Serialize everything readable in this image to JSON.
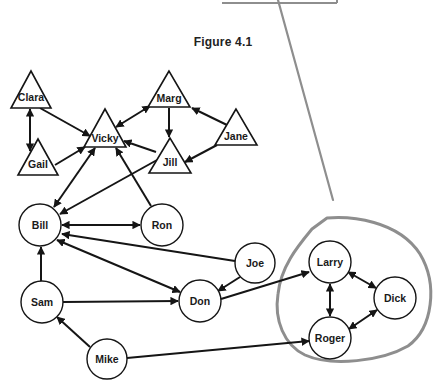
{
  "figure": {
    "title": "Figure 4.1"
  },
  "colors": {
    "ink": "#151515",
    "annotation": "#8e8e8e",
    "node_fill": "#ffffff"
  },
  "nodes": [
    {
      "id": "clara",
      "label": "Clara",
      "shape": "triangle",
      "apex": [
        31,
        71
      ],
      "base_y": 108,
      "half_w": 20,
      "label_y": 101
    },
    {
      "id": "gail",
      "label": "Gail",
      "shape": "triangle",
      "apex": [
        38,
        139
      ],
      "base_y": 175,
      "half_w": 20,
      "label_y": 168
    },
    {
      "id": "vicky",
      "label": "Vicky",
      "shape": "triangle",
      "apex": [
        105,
        109
      ],
      "base_y": 147,
      "half_w": 21,
      "label_y": 142
    },
    {
      "id": "marg",
      "label": "Marg",
      "shape": "triangle",
      "apex": [
        169,
        71
      ],
      "base_y": 107,
      "half_w": 21,
      "label_y": 102
    },
    {
      "id": "jane",
      "label": "Jane",
      "shape": "triangle",
      "apex": [
        236,
        109
      ],
      "base_y": 145,
      "half_w": 21,
      "label_y": 140
    },
    {
      "id": "jill",
      "label": "Jill",
      "shape": "triangle",
      "apex": [
        170,
        138
      ],
      "base_y": 173,
      "half_w": 21,
      "label_y": 166
    },
    {
      "id": "bill",
      "label": "Bill",
      "shape": "circle",
      "cx": 40,
      "cy": 225,
      "r": 21
    },
    {
      "id": "ron",
      "label": "Ron",
      "shape": "circle",
      "cx": 162,
      "cy": 225,
      "r": 21
    },
    {
      "id": "joe",
      "label": "Joe",
      "shape": "circle",
      "cx": 255,
      "cy": 263,
      "r": 20
    },
    {
      "id": "sam",
      "label": "Sam",
      "shape": "circle",
      "cx": 42,
      "cy": 302,
      "r": 21
    },
    {
      "id": "don",
      "label": "Don",
      "shape": "circle",
      "cx": 200,
      "cy": 301,
      "r": 21
    },
    {
      "id": "mike",
      "label": "Mike",
      "shape": "circle",
      "cx": 107,
      "cy": 359,
      "r": 20
    },
    {
      "id": "larry",
      "label": "Larry",
      "shape": "circle",
      "cx": 330,
      "cy": 262,
      "r": 21
    },
    {
      "id": "dick",
      "label": "Dick",
      "shape": "circle",
      "cx": 395,
      "cy": 298,
      "r": 21
    },
    {
      "id": "roger",
      "label": "Roger",
      "shape": "circle",
      "cx": 330,
      "cy": 338,
      "r": 21
    }
  ],
  "edges": [
    {
      "from": "clara",
      "to": "gail",
      "arrow": "both",
      "pts": [
        30,
        109,
        30,
        151
      ]
    },
    {
      "from": "clara",
      "to": "vicky",
      "arrow": "end",
      "pts": [
        40,
        108,
        90,
        136
      ]
    },
    {
      "from": "gail",
      "to": "vicky",
      "arrow": "end",
      "pts": [
        55,
        165,
        85,
        147
      ]
    },
    {
      "from": "vicky",
      "to": "bill",
      "arrow": "both",
      "pts": [
        95,
        148,
        54,
        207
      ]
    },
    {
      "from": "jill",
      "to": "bill",
      "arrow": "end",
      "pts": [
        157,
        160,
        60,
        214
      ]
    },
    {
      "from": "ron",
      "to": "vicky",
      "arrow": "end",
      "pts": [
        151,
        206,
        116,
        148
      ]
    },
    {
      "from": "jill",
      "to": "vicky",
      "arrow": "end",
      "pts": [
        156,
        152,
        124,
        141
      ]
    },
    {
      "from": "marg",
      "to": "vicky",
      "arrow": "both",
      "pts": [
        150,
        106,
        116,
        127
      ]
    },
    {
      "from": "marg",
      "to": "jill",
      "arrow": "end",
      "pts": [
        169,
        108,
        169,
        137
      ]
    },
    {
      "from": "jane",
      "to": "marg",
      "arrow": "end",
      "pts": [
        227,
        125,
        192,
        108
      ]
    },
    {
      "from": "jane",
      "to": "jill",
      "arrow": "end",
      "pts": [
        217,
        145,
        185,
        162
      ]
    },
    {
      "from": "bill",
      "to": "ron",
      "arrow": "both",
      "pts": [
        62,
        225,
        140,
        225
      ]
    },
    {
      "from": "joe",
      "to": "bill",
      "arrow": "end",
      "pts": [
        235,
        261,
        62,
        234
      ]
    },
    {
      "from": "don",
      "to": "bill",
      "arrow": "both",
      "pts": [
        180,
        292,
        57,
        240
      ]
    },
    {
      "from": "sam",
      "to": "bill",
      "arrow": "end",
      "pts": [
        41,
        281,
        41,
        247
      ]
    },
    {
      "from": "sam",
      "to": "don",
      "arrow": "end",
      "pts": [
        63,
        302,
        178,
        301
      ]
    },
    {
      "from": "joe",
      "to": "don",
      "arrow": "end",
      "pts": [
        240,
        277,
        218,
        291
      ]
    },
    {
      "from": "mike",
      "to": "sam",
      "arrow": "end",
      "pts": [
        90,
        347,
        57,
        317
      ]
    },
    {
      "from": "don",
      "to": "larry",
      "arrow": "end",
      "pts": [
        221,
        299,
        309,
        272
      ]
    },
    {
      "from": "mike",
      "to": "roger",
      "arrow": "end",
      "pts": [
        127,
        358,
        309,
        341
      ]
    },
    {
      "from": "larry",
      "to": "roger",
      "arrow": "both",
      "pts": [
        330,
        284,
        330,
        316
      ]
    },
    {
      "from": "larry",
      "to": "dick",
      "arrow": "both",
      "pts": [
        348,
        272,
        376,
        288
      ]
    },
    {
      "from": "roger",
      "to": "dick",
      "arrow": "both",
      "pts": [
        349,
        329,
        377,
        310
      ]
    }
  ],
  "annotations": {
    "pointer_line": [
      278,
      0,
      333,
      200
    ],
    "top_box_edge": [
      222,
      3,
      337,
      3
    ],
    "cluster_loop_path": "M 327 218 C 350 216, 398 220, 420 254 C 438 284, 433 328, 408 346 C 382 361, 332 367, 305 355 C 284 345, 274 320, 278 294 C 281 266, 298 246, 312 229 L 327 218",
    "cluster_members": [
      "larry",
      "dick",
      "roger"
    ]
  }
}
